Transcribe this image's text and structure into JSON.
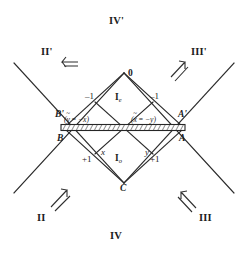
{
  "figure": {
    "type": "conformal-penrose-diagram",
    "background_color": "#ffffff",
    "line_color": "#2a2a2a",
    "hatch_band_color": "#3a3a3a"
  },
  "regions": {
    "top": "IV'",
    "upper_left": "II'",
    "upper_right": "III'",
    "lower_left": "II",
    "lower_right": "III",
    "bottom": "IV",
    "interior_even": "I",
    "interior_even_sub": "e",
    "interior_odd": "I",
    "interior_odd_sub": "o"
  },
  "vertices": {
    "top": "0",
    "bottom": "C",
    "left_upper": "B'",
    "left_lower": "B",
    "right_upper": "A'",
    "right_lower": "A"
  },
  "edge_values": {
    "upper_left": "–1",
    "upper_right": "–1",
    "lower_left": "+1",
    "lower_right": "+1"
  },
  "coordinates": {
    "left_var": "x",
    "right_var": "y"
  },
  "relations": {
    "left": {
      "lhs": "y",
      "op": " = ",
      "rhs": "−x",
      "open": "(",
      "close": ")"
    },
    "right": {
      "lhs": "x",
      "op": " = ",
      "rhs": "−y",
      "open": "(",
      "close": ")"
    }
  },
  "arrows": {
    "upper_left": "arrow-left-icon",
    "upper_right": "arrow-up-right-icon",
    "lower_left": "arrow-up-right-icon",
    "lower_right": "arrow-up-left-icon"
  }
}
